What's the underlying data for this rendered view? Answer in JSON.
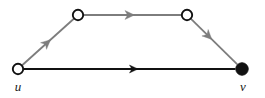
{
  "figure": {
    "name": "directed-graph-shortcut",
    "background_color": "#ffffff",
    "width": 265,
    "height": 98
  },
  "colors": {
    "direct_edge": "#111111",
    "path_edge": "#7d7d7d",
    "node_stroke": "#111111",
    "node_fill_hollow": "#ffffff",
    "node_fill_solid": "#111111",
    "label_color": "#1a1a1a"
  },
  "chart_data": {
    "type": "diagram",
    "diagram_kind": "directed-graph",
    "title": "",
    "nodes": [
      {
        "id": "u",
        "label": "u",
        "x": 18,
        "y": 69,
        "style": "hollow",
        "radius": 5.2,
        "label_x": 18,
        "label_y": 91
      },
      {
        "id": "w1",
        "label": "",
        "x": 78,
        "y": 15,
        "style": "hollow",
        "radius": 5.2,
        "label_x": 0,
        "label_y": 0
      },
      {
        "id": "w2",
        "label": "",
        "x": 187,
        "y": 15,
        "style": "hollow",
        "radius": 5.2,
        "label_x": 0,
        "label_y": 0
      },
      {
        "id": "v",
        "label": "v",
        "x": 242,
        "y": 69,
        "style": "solid",
        "radius": 6.2,
        "label_x": 243,
        "label_y": 91
      }
    ],
    "edges": [
      {
        "id": "u-v",
        "from": "u",
        "to": "v",
        "color_key": "direct_edge",
        "width": 2.0,
        "arrow_t": 0.54,
        "arrow_size": 8.5,
        "style": "direct"
      },
      {
        "id": "u-w1",
        "from": "u",
        "to": "w1",
        "color_key": "path_edge",
        "width": 1.8,
        "arrow_t": 0.55,
        "arrow_size": 9.5,
        "style": "path"
      },
      {
        "id": "w1-w2",
        "from": "w1",
        "to": "w2",
        "color_key": "path_edge",
        "width": 2.2,
        "arrow_t": 0.52,
        "arrow_size": 9.5,
        "style": "path"
      },
      {
        "id": "w2-v",
        "from": "w2",
        "to": "v",
        "color_key": "path_edge",
        "width": 1.8,
        "arrow_t": 0.45,
        "arrow_size": 9.5,
        "style": "path"
      }
    ],
    "annotations": [],
    "legend": {
      "visible": false,
      "entries": []
    },
    "grid": false,
    "axes": false
  }
}
